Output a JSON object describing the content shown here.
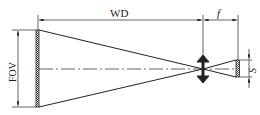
{
  "diagram": {
    "type": "optical-imaging-schematic",
    "labels": {
      "working_distance": "WD",
      "focal_length": "f",
      "field_of_view": "FOV",
      "sensor_size": "S"
    },
    "colors": {
      "line": "#222222",
      "background": "#ffffff",
      "hatch": "#555555"
    }
  }
}
